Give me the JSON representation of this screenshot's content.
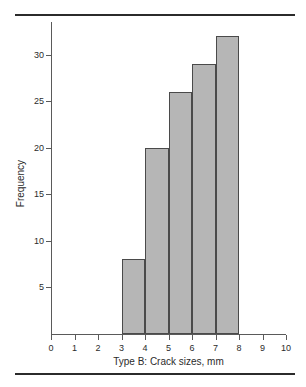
{
  "chart_data": {
    "type": "bar",
    "title": "",
    "subtitle": "",
    "xlabel": "Type B: Crack sizes, mm",
    "ylabel": "Frequency",
    "bin_edges": [
      3,
      4,
      5,
      6,
      7,
      8
    ],
    "categories": [
      "3-4",
      "4-5",
      "5-6",
      "6-7",
      "7-8"
    ],
    "values": [
      8,
      20,
      26,
      29,
      32
    ],
    "xlim": [
      0,
      10
    ],
    "ylim": [
      0,
      33.5
    ],
    "xticks": [
      0,
      1,
      2,
      3,
      4,
      5,
      6,
      7,
      8,
      9,
      10
    ],
    "xtick_labels": [
      "0",
      "1",
      "2",
      "3",
      "4",
      "5",
      "6",
      "7",
      "8",
      "9",
      "10"
    ],
    "yticks": [
      5,
      10,
      15,
      20,
      25,
      30
    ],
    "ytick_labels": [
      "5",
      "10",
      "15",
      "20",
      "25",
      "30"
    ],
    "grid": false,
    "legend": false,
    "legend_position": "none",
    "bar_fill_color": "#b6b6b6",
    "bar_edge_color": "#4a4a4a",
    "axis_color": "#5a5a5a",
    "rule_color": "#2b2b2b",
    "background_color": "#ffffff"
  }
}
